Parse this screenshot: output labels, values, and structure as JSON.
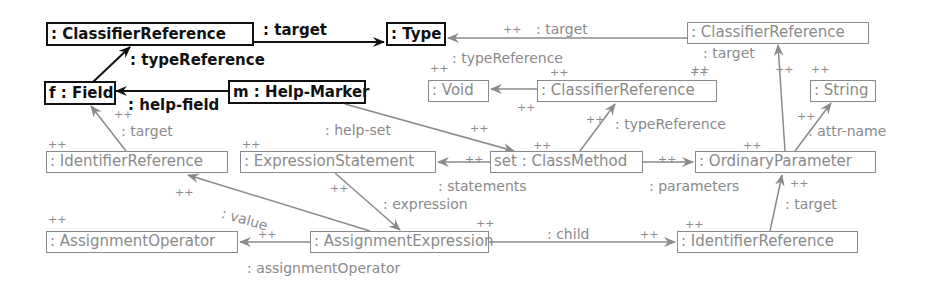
{
  "diagram": {
    "colors": {
      "context": "#111111",
      "created": "#8a8a8a",
      "background": "#ffffff"
    },
    "create_marker": "++",
    "nodes": {
      "n1": {
        "label": ": ClassifierReference",
        "style": "bold"
      },
      "n2": {
        "label": ": Type",
        "style": "bold"
      },
      "n3": {
        "label": "f : Field",
        "style": "bold"
      },
      "n4": {
        "label": "m : Help-Marker",
        "style": "bold"
      },
      "n5": {
        "label": ": ClassifierReference",
        "style": "gray"
      },
      "n6": {
        "label": ": Void",
        "style": "gray"
      },
      "n7": {
        "label": ": ClassifierReference",
        "style": "gray"
      },
      "n8": {
        "label": ": String",
        "style": "gray"
      },
      "n9": {
        "label": ": IdentifierReference",
        "style": "gray"
      },
      "n10": {
        "label": ": ExpressionStatement",
        "style": "gray"
      },
      "n11": {
        "label": "set : ClassMethod",
        "style": "gray"
      },
      "n12": {
        "label": ": OrdinaryParameter",
        "style": "gray"
      },
      "n13": {
        "label": ": AssignmentOperator",
        "style": "gray"
      },
      "n14": {
        "label": ": AssignmentExpression",
        "style": "gray"
      },
      "n15": {
        "label": ": IdentifierReference",
        "style": "gray"
      }
    },
    "edges": {
      "e1": {
        "label": ": target",
        "from": "n1",
        "to": "n2",
        "style": "bold"
      },
      "e2": {
        "label": ": typeReference",
        "from": "n3",
        "to": "n1",
        "style": "bold"
      },
      "e3": {
        "label": ": help-field",
        "from": "n4",
        "to": "n3",
        "style": "bold"
      },
      "e4": {
        "label": ": target",
        "from": "n5",
        "to": "n2",
        "style": "gray"
      },
      "e5": {
        "label": ": typeReference",
        "from": "n7",
        "to": "n6",
        "style": "gray"
      },
      "e6": {
        "label": ": help-set",
        "from": "n4",
        "to": "n11",
        "style": "gray"
      },
      "e7": {
        "label": ": typeReference",
        "from": "n11",
        "to": "n7",
        "style": "gray"
      },
      "e8": {
        "label": ": target",
        "from": "n12",
        "to": "n5",
        "style": "gray"
      },
      "e9": {
        "label": ": attr-name",
        "from": "n12",
        "to": "n8",
        "style": "gray"
      },
      "e10": {
        "label": ": target",
        "from": "n9",
        "to": "n3",
        "style": "gray"
      },
      "e11": {
        "label": ": statements",
        "from": "n11",
        "to": "n10",
        "style": "gray"
      },
      "e12": {
        "label": ": parameters",
        "from": "n11",
        "to": "n12",
        "style": "gray"
      },
      "e13": {
        "label": ": value",
        "from": "n14",
        "to": "n9",
        "style": "gray"
      },
      "e14": {
        "label": ": expression",
        "from": "n10",
        "to": "n14",
        "style": "gray"
      },
      "e15": {
        "label": ": assignmentOperator",
        "from": "n14",
        "to": "n13",
        "style": "gray"
      },
      "e16": {
        "label": ": child",
        "from": "n14",
        "to": "n15",
        "style": "gray"
      },
      "e17": {
        "label": ": target",
        "from": "n15",
        "to": "n12",
        "style": "gray"
      }
    }
  }
}
